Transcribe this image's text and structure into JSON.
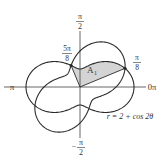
{
  "figure": {
    "width": 165,
    "height": 163,
    "origin": [
      80,
      87
    ],
    "scale_px_per_unit": 18,
    "colors": {
      "curve": "#2a2a2a",
      "axis": "#555555",
      "shade": "#d4d4d4",
      "text": "#333333"
    }
  },
  "axes": {
    "labels": {
      "top": {
        "num": "π",
        "den": "2",
        "sign": ""
      },
      "bottom": {
        "num": "π",
        "den": "2",
        "sign": "−"
      },
      "left": "π",
      "right": "0π"
    }
  },
  "curves": [
    {
      "name": "r-2-plus-cos-2theta",
      "a": 2,
      "b": 1,
      "phase_deg": 0
    },
    {
      "name": "r-2-plus-sin-2theta",
      "a": 2,
      "b": 1,
      "phase_deg": 45
    }
  ],
  "region": {
    "label": "A",
    "subscript": "1",
    "theta_start_deg": 22.5,
    "theta_end_deg": 112.5,
    "boundary_curve_index": 0
  },
  "points": [
    {
      "label_num": "5π",
      "label_den": "8",
      "theta_deg": 112.5
    },
    {
      "label_num": "π",
      "label_den": "8",
      "theta_deg": 22.5
    }
  ],
  "equation_label": "r = 2 + cos 2θ"
}
